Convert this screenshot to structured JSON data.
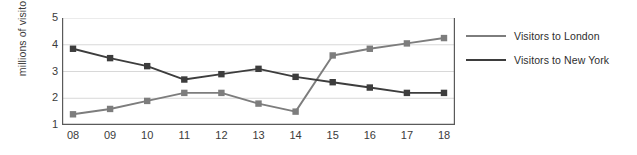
{
  "chart_data": {
    "type": "line",
    "title": "",
    "xlabel": "",
    "ylabel": "millions of visitors",
    "x": [
      "08",
      "09",
      "10",
      "11",
      "12",
      "13",
      "14",
      "15",
      "16",
      "17",
      "18"
    ],
    "categories": [
      "08",
      "09",
      "10",
      "11",
      "12",
      "13",
      "14",
      "15",
      "16",
      "17",
      "18"
    ],
    "xlim": [
      0,
      10
    ],
    "ylim": [
      1,
      5
    ],
    "yticks": [
      1,
      2,
      3,
      4,
      5
    ],
    "ytick_labels": [
      "1",
      "2",
      "3",
      "4",
      "5"
    ],
    "grid": true,
    "grid_axis": "y",
    "legend_position": "right",
    "markers": "square",
    "series": [
      {
        "name": "Visitors to London",
        "color": "#7d7d7d",
        "values": [
          1.4,
          1.6,
          1.9,
          2.2,
          2.2,
          1.8,
          1.5,
          3.6,
          3.85,
          4.05,
          4.25
        ]
      },
      {
        "name": "Visitors to New York",
        "color": "#3d3d3d",
        "values": [
          3.85,
          3.5,
          3.2,
          2.7,
          2.9,
          3.1,
          2.8,
          2.6,
          2.4,
          2.2,
          2.2
        ]
      }
    ]
  },
  "legend": {
    "items": [
      {
        "label": "Visitors to London",
        "color": "#7d7d7d"
      },
      {
        "label": "Visitors to New York",
        "color": "#3d3d3d"
      }
    ]
  },
  "axis": {
    "y_title": "millions of visitors",
    "y_labels": [
      "5",
      "4",
      "3",
      "2",
      "1"
    ],
    "x_labels": [
      "08",
      "09",
      "10",
      "11",
      "12",
      "13",
      "14",
      "15",
      "16",
      "17",
      "18"
    ]
  },
  "colors": {
    "london_line": "#7d7d7d",
    "newyork_line": "#3d3d3d",
    "grid": "#d8d8d8",
    "axis": "#5a5a5a",
    "text": "#3b3b3b",
    "background": "#ffffff"
  }
}
